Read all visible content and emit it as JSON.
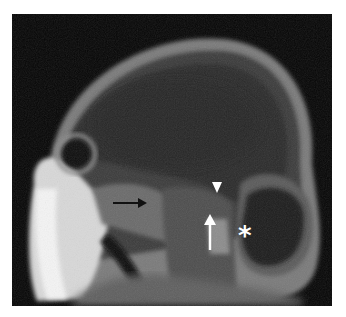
{
  "figure": {
    "background_color": "#050505",
    "page_color": "#ffffff"
  },
  "annotations": {
    "black_arrow": {
      "direction": "right",
      "color": "#111111"
    },
    "white_arrowhead": {
      "direction": "down",
      "color": "#ffffff"
    },
    "white_arrow": {
      "direction": "up",
      "color": "#ffffff"
    },
    "asterisk": {
      "label": "*",
      "color": "#ffffff"
    }
  }
}
